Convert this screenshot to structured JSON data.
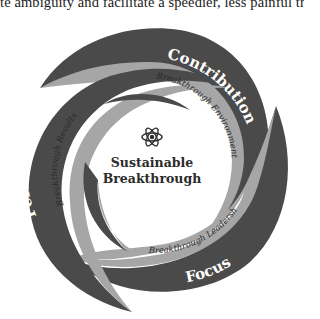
{
  "header_text": "te ambiguity and facilitate a speedier, less painful transiti",
  "center": {
    "icon": "atom-icon",
    "title_line1": "Sustainable",
    "title_line2": "Breakthrough"
  },
  "arms": [
    {
      "label": "Contribution",
      "band_label": "Breakthrough Environment"
    },
    {
      "label": "Focus",
      "band_label": "Breakthrough Leadership"
    },
    {
      "label": "Performance",
      "band_label": "Breakthrough Results"
    }
  ],
  "colors": {
    "dark_band": "#4a4a4a",
    "light_band": "#a6a6a6",
    "background": "#ffffff",
    "label_text": "#ffffff",
    "band_text": "#2a2a2a"
  }
}
